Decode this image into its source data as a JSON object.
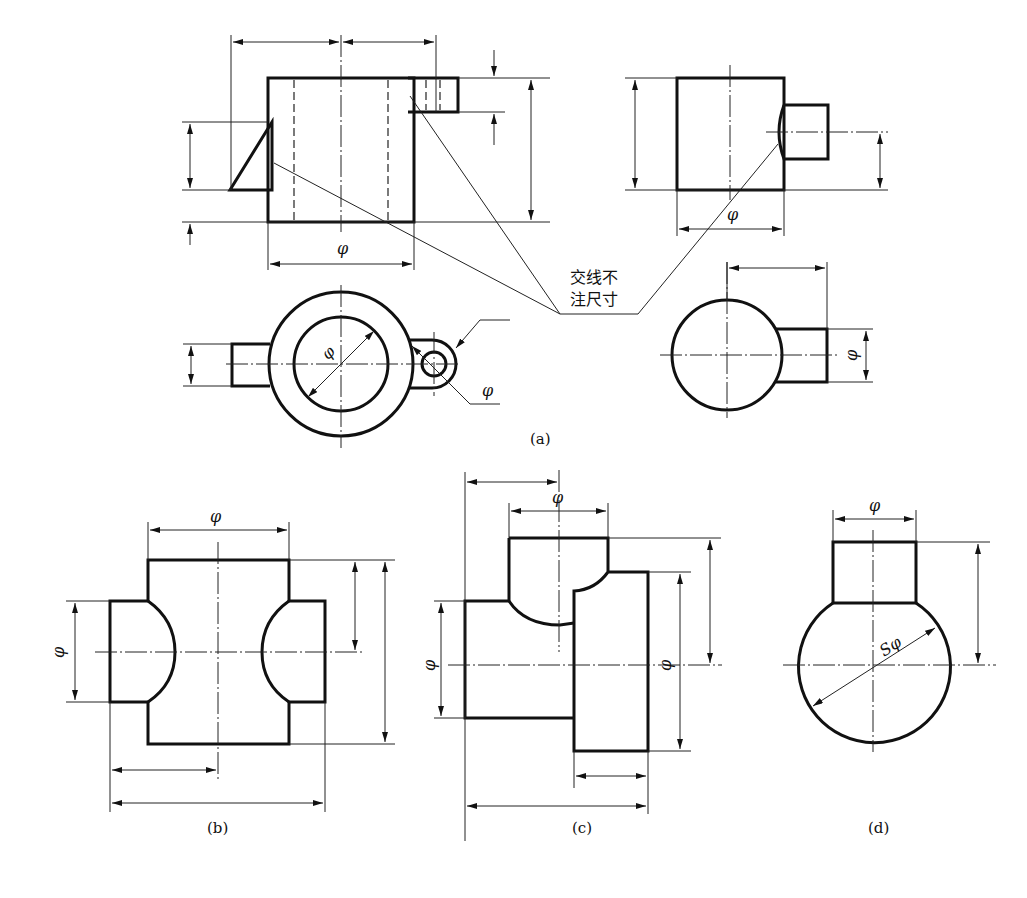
{
  "figure": {
    "labels": {
      "a": "(a)",
      "b": "(b)",
      "c": "(c)",
      "d": "(d)"
    },
    "note": {
      "line1": "交线不",
      "line2": "注尺寸"
    },
    "symbols": {
      "diameter": "φ",
      "sphere_diameter": "Sφ"
    }
  }
}
